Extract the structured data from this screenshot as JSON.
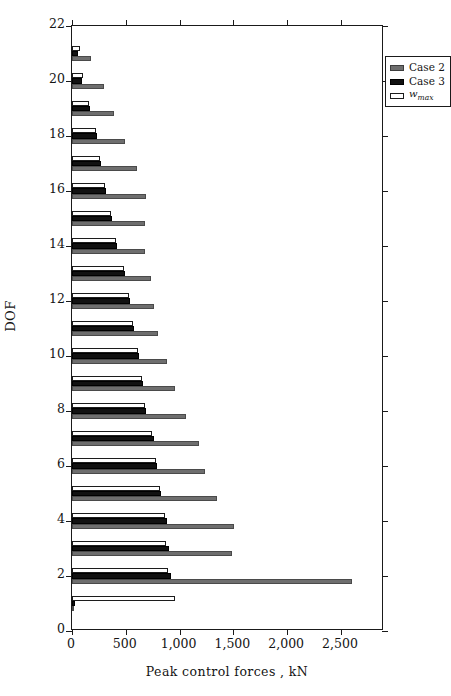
{
  "chart_data": {
    "type": "bar",
    "orientation": "horizontal",
    "title": "",
    "xlabel": "Peak control forces , kN",
    "ylabel": "DOF",
    "xlim": [
      0,
      2900
    ],
    "ylim": [
      0,
      22
    ],
    "xticks": [
      0,
      500,
      1000,
      1500,
      2000,
      2500
    ],
    "xticklabels": [
      "0",
      "500",
      "1,000",
      "1,500",
      "2,000",
      "2,500"
    ],
    "yticks": [
      0,
      2,
      4,
      6,
      8,
      10,
      12,
      14,
      16,
      18,
      20,
      22
    ],
    "yticklabels": [
      "0",
      "2",
      "4",
      "6",
      "8",
      "10",
      "12",
      "14",
      "16",
      "18",
      "20",
      "22"
    ],
    "grid": false,
    "legend_position": "top-right",
    "legend": [
      "Case 2",
      "Case 3",
      "w_max"
    ],
    "categories": [
      1,
      2,
      3,
      4,
      5,
      6,
      7,
      8,
      9,
      10,
      11,
      12,
      13,
      14,
      15,
      16,
      17,
      18,
      19,
      20,
      21
    ],
    "series": [
      {
        "name": "Case 2",
        "color": "#6e6e6e",
        "values": [
          0,
          2600,
          1490,
          1510,
          1350,
          1240,
          1180,
          1060,
          960,
          880,
          800,
          760,
          730,
          680,
          680,
          690,
          600,
          490,
          390,
          300,
          180
        ]
      },
      {
        "name": "Case 3",
        "color": "#111111",
        "values": [
          30,
          920,
          900,
          880,
          830,
          790,
          760,
          690,
          660,
          620,
          580,
          540,
          490,
          420,
          370,
          320,
          270,
          230,
          170,
          90,
          60
        ]
      },
      {
        "name": "w_max",
        "color": "#ffffff",
        "values": [
          960,
          890,
          870,
          860,
          820,
          780,
          740,
          680,
          650,
          610,
          570,
          530,
          480,
          410,
          360,
          310,
          260,
          220,
          160,
          100,
          70
        ]
      }
    ]
  },
  "axes": {
    "x_title": "Peak control forces , kN",
    "y_title": "DOF"
  },
  "legend": {
    "items": [
      {
        "label": "Case 2",
        "swatch": "gray-filled-swatch"
      },
      {
        "label": "Case 3",
        "swatch": "black-filled-swatch"
      },
      {
        "label": "w",
        "sub": "max",
        "swatch": "white-open-swatch"
      }
    ]
  }
}
